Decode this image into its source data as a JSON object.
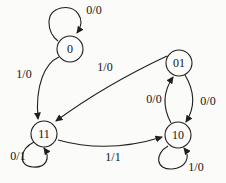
{
  "diagram": {
    "kind": "state-transition-diagram",
    "colors": {
      "line": "#1f1f1f",
      "background": "#fbfbf9",
      "text": "#141414"
    },
    "states": [
      {
        "id": "0",
        "label": "0"
      },
      {
        "id": "01",
        "label": "01"
      },
      {
        "id": "11",
        "label": "11"
      },
      {
        "id": "10",
        "label": "10"
      }
    ],
    "transitions": [
      {
        "from": "0",
        "to": "0",
        "label": "0/0"
      },
      {
        "from": "0",
        "to": "11",
        "label": "1/0"
      },
      {
        "from": "01",
        "to": "11",
        "label": "1/0"
      },
      {
        "from": "10",
        "to": "01",
        "label": "0/0"
      },
      {
        "from": "01",
        "to": "10",
        "label": "0/0"
      },
      {
        "from": "11",
        "to": "11",
        "label": "0/1"
      },
      {
        "from": "11",
        "to": "10",
        "label": "1/1"
      },
      {
        "from": "10",
        "to": "10",
        "label": "1/0"
      }
    ]
  }
}
